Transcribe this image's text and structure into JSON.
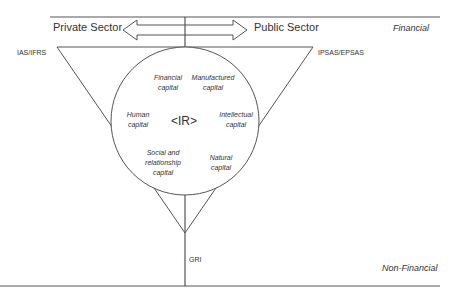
{
  "diagram": {
    "arrow": {
      "left_label": "Private Sector",
      "right_label": "Public Sector"
    },
    "axis": {
      "top_label": "Financial",
      "bottom_label": "Non-Financial"
    },
    "standards": {
      "top_left": "IAS/IFRS",
      "top_right": "IPSAS/EPSAS",
      "bottom": "GRI"
    },
    "center": {
      "label": "<IR>"
    },
    "capitals": [
      {
        "line1": "Financial",
        "line2": "capital"
      },
      {
        "line1": "Manufactured",
        "line2": "capital"
      },
      {
        "line1": "Human",
        "line2": "capital"
      },
      {
        "line1": "Intellectual",
        "line2": "capital"
      },
      {
        "line1": "Social and",
        "line2": "relationship",
        "line3": "capital"
      },
      {
        "line1": "Natural",
        "line2": "capital"
      }
    ],
    "colors": {
      "line": "#555555",
      "text": "#333333",
      "background": "#ffffff"
    }
  }
}
